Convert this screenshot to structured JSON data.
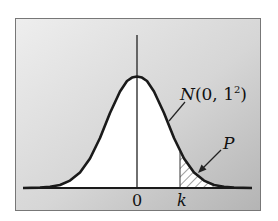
{
  "figure": {
    "type": "normal-distribution-diagram",
    "distribution_label": {
      "N": "N",
      "open": "(0, 1",
      "sup": "2",
      "close": ")"
    },
    "area_label": "P",
    "x_ticks": {
      "zero": "0",
      "k": "k"
    },
    "colors": {
      "background_light": "#ececec",
      "background_dark": "#b8b8b8",
      "curve": "#1a1a1a",
      "fill_under_curve": "#ffffff",
      "hatch": "#333333"
    },
    "mean": 0,
    "std": 1,
    "shaded_region": "x > k (right tail)"
  }
}
